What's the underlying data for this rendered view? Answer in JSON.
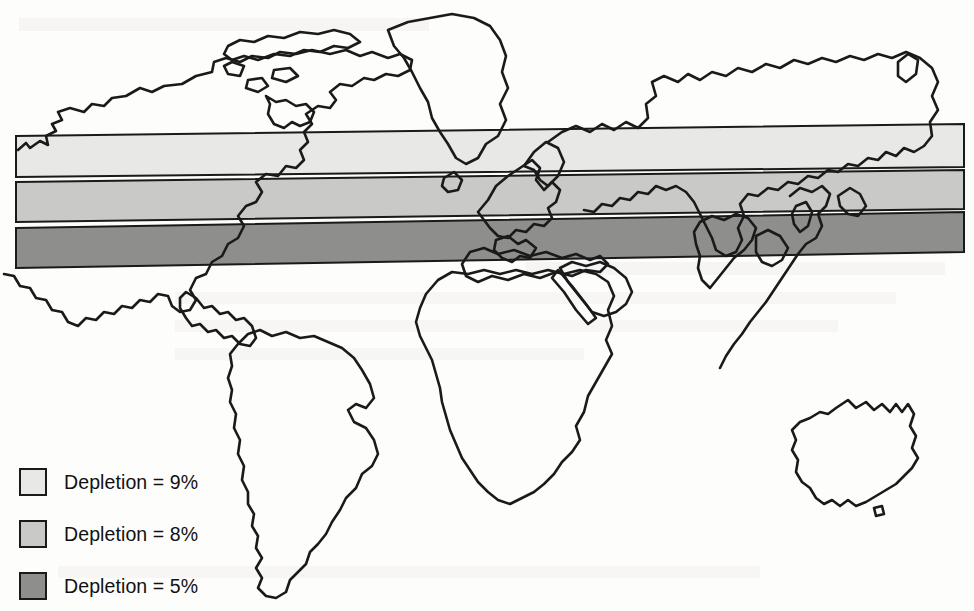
{
  "figure": {
    "type": "world-map-thematic",
    "width": 974,
    "height": 611,
    "background_color": "#fdfdfc",
    "outline_color": "#1a1a1a"
  },
  "legend": {
    "items": [
      {
        "label": "Depletion = 9%",
        "value": 9,
        "unit": "%",
        "color": "#e8e8e6",
        "swatch_name": "legend-swatch-9"
      },
      {
        "label": "Depletion = 8%",
        "value": 8,
        "unit": "%",
        "color": "#c9c9c7",
        "swatch_name": "legend-swatch-8"
      },
      {
        "label": "Depletion = 5%",
        "value": 5,
        "unit": "%",
        "color": "#8e8e8c",
        "swatch_name": "legend-swatch-5"
      }
    ]
  },
  "chart_data": {
    "type": "map",
    "title": "",
    "xlabel": "",
    "ylabel": "",
    "projection": "equirectangular-schematic",
    "grid": false,
    "legend_position": "bottom-left",
    "bands": [
      {
        "name": "band-depletion-9",
        "depletion_percent": 9,
        "label": "Depletion = 9%",
        "fill": "#e8e8e6",
        "stroke": "#1a1a1a",
        "latitude_zone": "high-northern",
        "polygon": "16,136 964,124 964,167 16,177"
      },
      {
        "name": "band-depletion-8",
        "depletion_percent": 8,
        "label": "Depletion = 8%",
        "fill": "#c9c9c7",
        "stroke": "#1a1a1a",
        "latitude_zone": "mid-northern",
        "polygon": "16,182 964,170 964,209 16,222"
      },
      {
        "name": "band-depletion-5",
        "depletion_percent": 5,
        "label": "Depletion = 5%",
        "fill": "#8e8e8c",
        "stroke": "#1a1a1a",
        "latitude_zone": "low-northern",
        "polygon": "16,228 964,212 964,252 16,268"
      }
    ],
    "landmasses": [
      "north-america",
      "greenland",
      "canadian-arctic-islands",
      "central-america",
      "south-america",
      "europe-scandinavia",
      "africa",
      "arabian-peninsula",
      "asia-russia",
      "india",
      "east-asia",
      "japan",
      "australia"
    ]
  }
}
